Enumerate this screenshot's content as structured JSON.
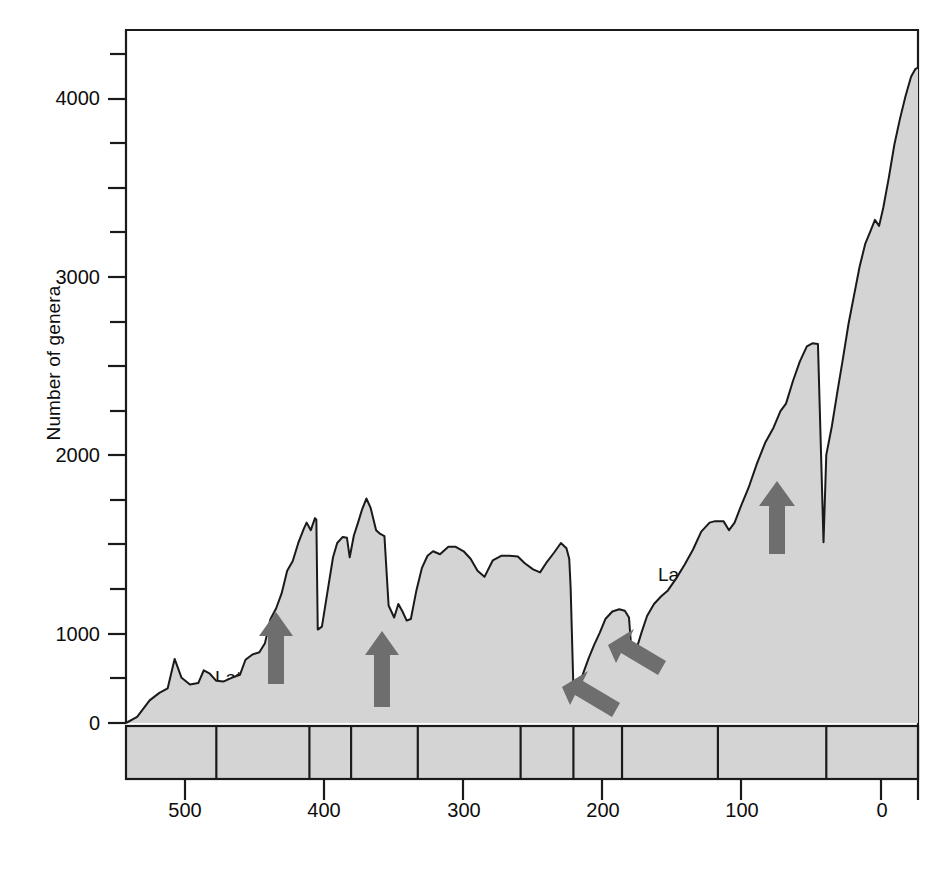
{
  "chart_data": {
    "type": "area",
    "title": "",
    "xlabel": "Geologic time in millions of years",
    "ylabel": "Number of genera",
    "xlim": [
      570,
      0
    ],
    "ylim": [
      0,
      4600
    ],
    "x_reversed": true,
    "grid": false,
    "legend": "none",
    "y_major_ticks": [
      0,
      1000,
      2000,
      3000,
      4000
    ],
    "y_minor_ticks": [
      500,
      1500,
      2500,
      3500,
      4500
    ],
    "y_tick_labels": [
      "0",
      "1000",
      "2000",
      "3000",
      "4000"
    ],
    "x_major_ticks": [
      500,
      400,
      300,
      200,
      100,
      0
    ],
    "x_tick_labels": [
      "500",
      "400",
      "300",
      "200",
      "100",
      "0"
    ],
    "series_name": "Marine animal genera",
    "fill_color": "#d4d4d4",
    "line_color": "#1a1a1a",
    "arrow_color": "#6e6e6e",
    "points": [
      [
        570,
        0
      ],
      [
        562,
        40
      ],
      [
        553,
        150
      ],
      [
        546,
        200
      ],
      [
        540,
        230
      ],
      [
        535,
        425
      ],
      [
        530,
        300
      ],
      [
        524,
        255
      ],
      [
        518,
        265
      ],
      [
        514,
        350
      ],
      [
        510,
        330
      ],
      [
        505,
        280
      ],
      [
        500,
        275
      ],
      [
        494,
        300
      ],
      [
        488,
        320
      ],
      [
        484,
        420
      ],
      [
        479,
        455
      ],
      [
        474,
        470
      ],
      [
        470,
        530
      ],
      [
        466,
        690
      ],
      [
        462,
        760
      ],
      [
        458,
        860
      ],
      [
        454,
        1010
      ],
      [
        450,
        1075
      ],
      [
        446,
        1195
      ],
      [
        442,
        1290
      ],
      [
        440,
        1330
      ],
      [
        437,
        1280
      ],
      [
        434,
        1360
      ],
      [
        433,
        1350
      ],
      [
        432,
        620
      ],
      [
        429,
        640
      ],
      [
        425,
        870
      ],
      [
        421,
        1100
      ],
      [
        418,
        1195
      ],
      [
        414,
        1235
      ],
      [
        411,
        1230
      ],
      [
        409,
        1100
      ],
      [
        406,
        1245
      ],
      [
        403,
        1330
      ],
      [
        400,
        1420
      ],
      [
        397,
        1490
      ],
      [
        394,
        1430
      ],
      [
        390,
        1280
      ],
      [
        387,
        1255
      ],
      [
        384,
        1240
      ],
      [
        381,
        780
      ],
      [
        377,
        700
      ],
      [
        374,
        790
      ],
      [
        371,
        740
      ],
      [
        368,
        680
      ],
      [
        365,
        690
      ],
      [
        361,
        880
      ],
      [
        357,
        1030
      ],
      [
        353,
        1110
      ],
      [
        349,
        1140
      ],
      [
        344,
        1120
      ],
      [
        338,
        1170
      ],
      [
        333,
        1170
      ],
      [
        327,
        1140
      ],
      [
        322,
        1090
      ],
      [
        317,
        1010
      ],
      [
        312,
        970
      ],
      [
        306,
        1080
      ],
      [
        300,
        1110
      ],
      [
        294,
        1110
      ],
      [
        288,
        1105
      ],
      [
        283,
        1060
      ],
      [
        277,
        1020
      ],
      [
        272,
        1000
      ],
      [
        267,
        1070
      ],
      [
        262,
        1130
      ],
      [
        257,
        1195
      ],
      [
        253,
        1160
      ],
      [
        251,
        1090
      ],
      [
        250,
        900
      ],
      [
        248,
        230
      ],
      [
        245,
        215
      ],
      [
        241,
        330
      ],
      [
        237,
        430
      ],
      [
        233,
        520
      ],
      [
        229,
        600
      ],
      [
        225,
        690
      ],
      [
        220,
        740
      ],
      [
        215,
        755
      ],
      [
        211,
        745
      ],
      [
        208,
        700
      ],
      [
        206,
        450
      ],
      [
        203,
        480
      ],
      [
        199,
        600
      ],
      [
        195,
        710
      ],
      [
        190,
        790
      ],
      [
        185,
        840
      ],
      [
        180,
        880
      ],
      [
        174,
        960
      ],
      [
        168,
        1050
      ],
      [
        162,
        1150
      ],
      [
        156,
        1270
      ],
      [
        150,
        1330
      ],
      [
        146,
        1340
      ],
      [
        140,
        1340
      ],
      [
        136,
        1280
      ],
      [
        132,
        1330
      ],
      [
        127,
        1450
      ],
      [
        122,
        1560
      ],
      [
        116,
        1720
      ],
      [
        110,
        1860
      ],
      [
        104,
        1960
      ],
      [
        99,
        2070
      ],
      [
        95,
        2120
      ],
      [
        90,
        2270
      ],
      [
        85,
        2400
      ],
      [
        80,
        2500
      ],
      [
        76,
        2520
      ],
      [
        72,
        2515
      ],
      [
        68,
        1200
      ],
      [
        66,
        1780
      ],
      [
        62,
        1970
      ],
      [
        58,
        2200
      ],
      [
        54,
        2420
      ],
      [
        50,
        2650
      ],
      [
        46,
        2840
      ],
      [
        42,
        3030
      ],
      [
        38,
        3180
      ],
      [
        34,
        3270
      ],
      [
        31,
        3340
      ],
      [
        28,
        3300
      ],
      [
        25,
        3420
      ],
      [
        21,
        3620
      ],
      [
        17,
        3840
      ],
      [
        13,
        4010
      ],
      [
        9,
        4160
      ],
      [
        5,
        4290
      ],
      [
        2,
        4340
      ],
      [
        0,
        4350
      ]
    ],
    "time_bands": [
      {
        "label": "Є",
        "name": "Cambrian",
        "start": 570,
        "end": 505
      },
      {
        "label": "ORD",
        "name": "Ordovician",
        "start": 505,
        "end": 438
      },
      {
        "label": "S",
        "name": "Silurian",
        "start": 438,
        "end": 408
      },
      {
        "label": "DEV",
        "name": "Devonian",
        "start": 408,
        "end": 360
      },
      {
        "label": "CARB",
        "name": "Carboniferous",
        "start": 360,
        "end": 286
      },
      {
        "label": "P",
        "name": "Permian",
        "start": 286,
        "end": 248
      },
      {
        "label": "TR",
        "name": "Triassic",
        "start": 248,
        "end": 213
      },
      {
        "label": "JUR",
        "name": "Jurassic",
        "start": 213,
        "end": 144
      },
      {
        "label": "CRET",
        "name": "Cretaceous",
        "start": 144,
        "end": 66
      },
      {
        "label": "CENO",
        "name": "Cenozoic",
        "start": 66,
        "end": 0
      }
    ],
    "annotations": [
      {
        "label": "Late Ordovician",
        "arrow": "up",
        "x": 440,
        "y": 300
      },
      {
        "label": "Late Devonian",
        "arrow": "up",
        "x": 368,
        "y": 250
      },
      {
        "label": "Late Permian",
        "arrow": "left",
        "x": 248,
        "y": 140
      },
      {
        "label": "Late Triassic",
        "arrow": "left",
        "x": 206,
        "y": 330
      },
      {
        "label": "Late Cretaceous",
        "arrow": "up",
        "x": 68,
        "y": 800
      }
    ]
  }
}
